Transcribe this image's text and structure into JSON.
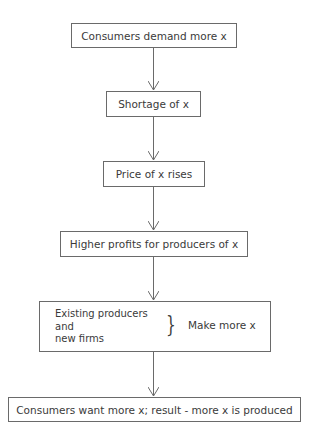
{
  "diagram": {
    "type": "flowchart",
    "direction": "top-to-bottom",
    "nodes": [
      {
        "id": "n1",
        "label": "Consumers demand more x"
      },
      {
        "id": "n2",
        "label": "Shortage of x"
      },
      {
        "id": "n3",
        "label": "Price of x rises"
      },
      {
        "id": "n4",
        "label": "Higher profits for producers of x"
      },
      {
        "id": "n5",
        "lines": [
          "Existing producers",
          "and",
          "new firms"
        ],
        "brace": "}",
        "label": "Make more x"
      },
      {
        "id": "n6",
        "label": "Consumers want more x; result - more x is produced"
      }
    ],
    "edges": [
      {
        "from": "n1",
        "to": "n2"
      },
      {
        "from": "n2",
        "to": "n3"
      },
      {
        "from": "n3",
        "to": "n4"
      },
      {
        "from": "n4",
        "to": "n5"
      },
      {
        "from": "n5",
        "to": "n6"
      }
    ]
  }
}
